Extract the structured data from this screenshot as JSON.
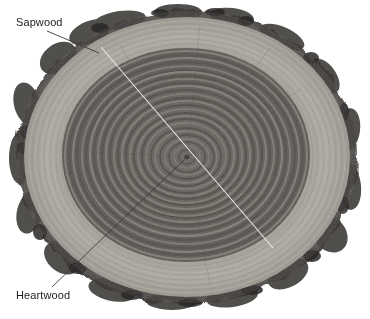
{
  "figure": {
    "name": "tree-trunk-cross-section",
    "background_color": "#ffffff",
    "width": 370,
    "height": 319
  },
  "annotations": [
    {
      "id": "sapwood",
      "label": "Sapwood",
      "text_x": 16,
      "text_y": 16,
      "leader": {
        "x1": 47,
        "y1": 31,
        "x2": 99,
        "y2": 53
      },
      "line_color": "#3c3c3c"
    },
    {
      "id": "heartwood",
      "label": "Heartwood",
      "text_x": 16,
      "text_y": 289,
      "leader": {
        "x1": 52,
        "y1": 287,
        "x2": 187,
        "y2": 157
      },
      "line_color": "#3c3c3c"
    }
  ],
  "radius_line": {
    "name": "radius-diagonal-line",
    "x1": 101,
    "y1": 47,
    "x2": 273,
    "y2": 248,
    "color": "#e8e8e8"
  },
  "specimen": {
    "pith": {
      "x": 187,
      "y": 157
    },
    "bark_color": "#4a4a4a",
    "sapwood_color": "#b0aca4",
    "heartwood_color": "#6b6862",
    "ring_light_color": "#9a968e",
    "ring_dark_color": "#575450",
    "outer_radius_x": 172,
    "outer_radius_y": 148,
    "sapwood_outer_ratio": 0.94,
    "heartwood_outer_ratio": 0.72,
    "ring_count": 28
  },
  "legend": {
    "zones": [
      {
        "name": "bark",
        "description": "Outer rough dark bark layer"
      },
      {
        "name": "sapwood",
        "description": "Light outer wood band"
      },
      {
        "name": "heartwood",
        "description": "Dark inner wood with annual rings"
      }
    ]
  }
}
